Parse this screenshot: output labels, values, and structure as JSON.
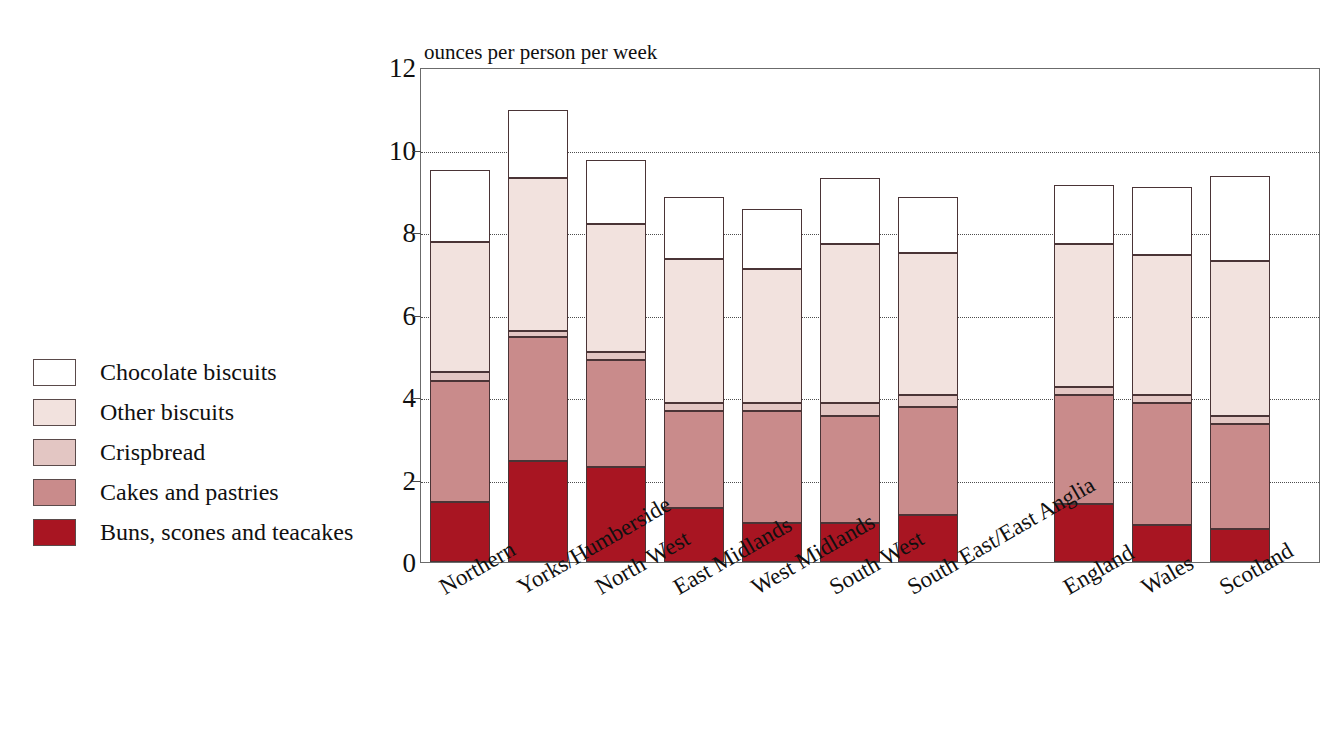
{
  "chart_data": {
    "type": "bar",
    "subtype": "stacked-bar",
    "title": "",
    "axis_note": "ounces per person per week",
    "xlabel": "",
    "ylabel": "ounces per person per week",
    "ylim": [
      0,
      12
    ],
    "ytick_labels": [
      "0",
      "2",
      "4",
      "6",
      "8",
      "10",
      "12"
    ],
    "ytick_values": [
      0,
      2,
      4,
      6,
      8,
      10,
      12
    ],
    "grid": "horizontal-dotted",
    "legend_position": "left",
    "categories": [
      "Northern",
      "Yorks/Humberside",
      "North West",
      "East Midlands",
      "West Midlands",
      "South West",
      "South East/East Anglia",
      "England",
      "Wales",
      "Scotland"
    ],
    "group_gap_after": "South East/East Anglia",
    "series": [
      {
        "name": "Buns, scones and teacakes",
        "color": "#a81522",
        "values": [
          1.45,
          2.45,
          2.3,
          1.3,
          0.95,
          0.95,
          1.15,
          1.4,
          0.9,
          0.8
        ]
      },
      {
        "name": "Cakes and pastries",
        "color": "#c98b8b",
        "values": [
          2.95,
          3.0,
          2.6,
          2.35,
          2.7,
          2.6,
          2.6,
          2.65,
          2.95,
          2.55
        ]
      },
      {
        "name": "Crispbread",
        "color": "#e3c6c3",
        "values": [
          0.2,
          0.15,
          0.2,
          0.2,
          0.2,
          0.3,
          0.3,
          0.2,
          0.2,
          0.2
        ]
      },
      {
        "name": "Other biscuits",
        "color": "#f2e2de",
        "values": [
          3.15,
          3.7,
          3.1,
          3.5,
          3.25,
          3.85,
          3.45,
          3.45,
          3.4,
          3.75
        ]
      },
      {
        "name": "Chocolate biscuits",
        "color": "#ffffff",
        "values": [
          1.75,
          1.65,
          1.55,
          1.5,
          1.45,
          1.6,
          1.35,
          1.45,
          1.65,
          2.05
        ]
      }
    ],
    "totals": [
      9.5,
      10.95,
      9.75,
      8.85,
      8.55,
      9.3,
      8.85,
      9.15,
      9.1,
      9.35
    ]
  },
  "legend": {
    "items": [
      {
        "label": "Chocolate biscuits",
        "color": "#ffffff"
      },
      {
        "label": "Other biscuits",
        "color": "#f2e2de"
      },
      {
        "label": "Crispbread",
        "color": "#e3c6c3"
      },
      {
        "label": "Cakes and pastries",
        "color": "#c98b8b"
      },
      {
        "label": "Buns, scones and teacakes",
        "color": "#a81522"
      }
    ]
  }
}
